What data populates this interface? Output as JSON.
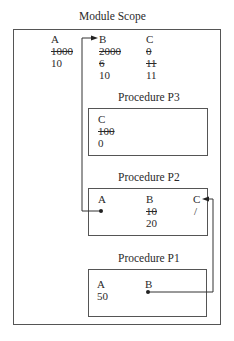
{
  "module": {
    "title": "Module Scope",
    "vars": [
      {
        "name": "A",
        "values": [
          {
            "v": "1000",
            "struck": true
          },
          {
            "v": "10",
            "struck": false
          }
        ]
      },
      {
        "name": "B",
        "values": [
          {
            "v": "2000",
            "struck": true
          },
          {
            "v": "6",
            "struck": true
          },
          {
            "v": "10",
            "struck": false
          }
        ]
      },
      {
        "name": "C",
        "values": [
          {
            "v": "0",
            "struck": true
          },
          {
            "v": "11",
            "struck": true
          },
          {
            "v": "11",
            "struck": false
          }
        ]
      }
    ]
  },
  "p3": {
    "title": "Procedure P3",
    "vars": [
      {
        "name": "C",
        "values": [
          {
            "v": "100",
            "struck": true
          },
          {
            "v": "0",
            "struck": false
          }
        ]
      }
    ]
  },
  "p2": {
    "title": "Procedure P2",
    "vars": [
      {
        "name": "A",
        "values": []
      },
      {
        "name": "B",
        "values": [
          {
            "v": "10",
            "struck": true
          },
          {
            "v": "20",
            "struck": false
          }
        ]
      },
      {
        "name": "C",
        "values": [
          {
            "v": "/",
            "struck": false
          }
        ]
      }
    ]
  },
  "p1": {
    "title": "Procedure P1",
    "vars": [
      {
        "name": "A",
        "values": [
          {
            "v": "50",
            "struck": false
          }
        ]
      },
      {
        "name": "B",
        "values": []
      }
    ]
  },
  "connectors": [
    {
      "from": "P2.A",
      "to": "Module.B",
      "type": "reference-arrow"
    },
    {
      "from": "P1.B",
      "to": "P2.C",
      "type": "reference-arrow"
    }
  ]
}
